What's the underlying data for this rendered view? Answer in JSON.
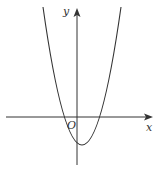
{
  "diagram": {
    "type": "parabola-graph",
    "axes": {
      "x_label": "x",
      "y_label": "y",
      "origin_label": "O"
    },
    "colors": {
      "line": "#333333",
      "background": "#ffffff"
    }
  }
}
